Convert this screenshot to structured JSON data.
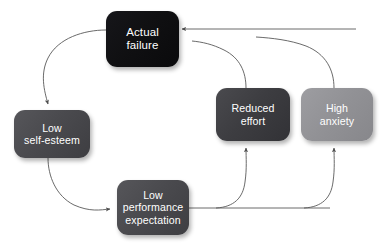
{
  "diagram": {
    "type": "cyclical-flowchart",
    "canvas": {
      "width": 386,
      "height": 243,
      "background": "#ffffff"
    },
    "connector_color": "#595959",
    "text_color": "#ffffff",
    "nodes": [
      {
        "id": "actual-failure",
        "label": "Actual\nfailure",
        "line1": "Actual",
        "line2": "failure",
        "color": "#101012",
        "shade": "black"
      },
      {
        "id": "low-self-esteem",
        "label": "Low\nself-esteem",
        "line1": "Low",
        "line2": "self-esteem",
        "color": "#4a4a4e",
        "shade": "dark-gray"
      },
      {
        "id": "low-performance-expectation",
        "label": "Low\nperformance\nexpectation",
        "line1": "Low",
        "line2": "performance",
        "line3": "expectation",
        "color": "#4a4a4e",
        "shade": "dark-gray"
      },
      {
        "id": "reduced-effort",
        "label": "Reduced\neffort",
        "line1": "Reduced",
        "line2": "effort",
        "color": "#3d3d41",
        "shade": "darker-gray"
      },
      {
        "id": "high-anxiety",
        "label": "High\nanxiety",
        "line1": "High",
        "line2": "anxiety",
        "color": "#929296",
        "shade": "light-gray"
      }
    ],
    "edges": [
      {
        "id": "edge-failure-to-self-esteem",
        "from": "actual-failure",
        "to": "low-self-esteem",
        "arrow": "down"
      },
      {
        "id": "edge-self-esteem-to-performance",
        "from": "low-self-esteem",
        "to": "low-performance-expectation",
        "arrow": "right"
      },
      {
        "id": "edge-performance-to-reduced-effort",
        "from": "low-performance-expectation",
        "to": "reduced-effort",
        "arrow": "up"
      },
      {
        "id": "edge-performance-to-high-anxiety",
        "from": "low-performance-expectation",
        "to": "high-anxiety",
        "arrow": "up"
      },
      {
        "id": "edge-reduced-effort-to-failure",
        "from": "reduced-effort",
        "to": "actual-failure",
        "arrow": "left"
      },
      {
        "id": "edge-high-anxiety-to-failure",
        "from": "high-anxiety",
        "to": "actual-failure",
        "arrow": "left"
      }
    ]
  }
}
